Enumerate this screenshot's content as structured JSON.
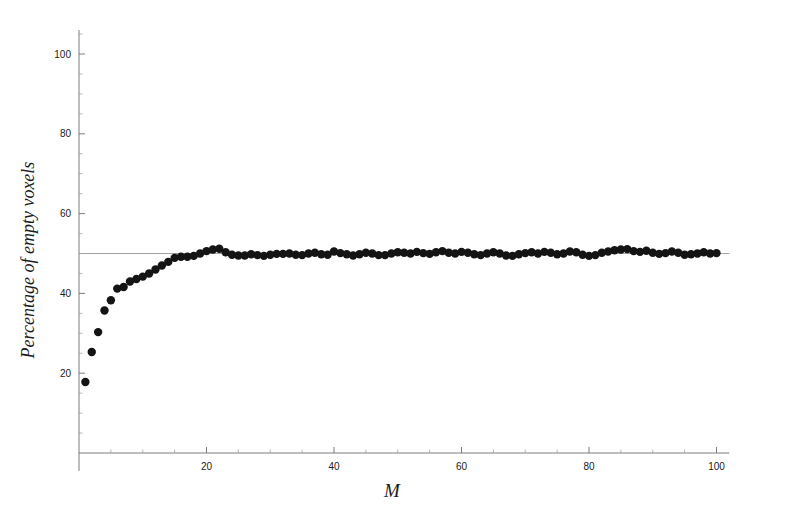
{
  "chart_data": {
    "type": "scatter",
    "title": "",
    "xlabel": "M",
    "ylabel": "Percentage of empty voxels",
    "xlim": [
      0,
      102
    ],
    "ylim": [
      0,
      106
    ],
    "grid": false,
    "legend": "none",
    "x_ticks": [
      20,
      40,
      60,
      80,
      100
    ],
    "y_ticks": [
      20,
      40,
      60,
      80,
      100
    ],
    "x_tick_labels": [
      "20",
      "40",
      "60",
      "80",
      "100"
    ],
    "y_tick_labels": [
      "20",
      "40",
      "60",
      "80",
      "100"
    ],
    "x_minor_step": 5,
    "y_minor_step": 5,
    "annotations": [
      {
        "name": "asymptote-line",
        "type": "hline",
        "value": 50,
        "color": "#8a8a8e"
      }
    ],
    "marker": {
      "shape": "circle",
      "size": 4.2,
      "color": "#141414"
    },
    "x": [
      1,
      2,
      3,
      4,
      5,
      6,
      7,
      8,
      9,
      10,
      11,
      12,
      13,
      14,
      15,
      16,
      17,
      18,
      19,
      20,
      21,
      22,
      23,
      24,
      25,
      26,
      27,
      28,
      29,
      30,
      31,
      32,
      33,
      34,
      35,
      36,
      37,
      38,
      39,
      40,
      41,
      42,
      43,
      44,
      45,
      46,
      47,
      48,
      49,
      50,
      51,
      52,
      53,
      54,
      55,
      56,
      57,
      58,
      59,
      60,
      61,
      62,
      63,
      64,
      65,
      66,
      67,
      68,
      69,
      70,
      71,
      72,
      73,
      74,
      75,
      76,
      77,
      78,
      79,
      80,
      81,
      82,
      83,
      84,
      85,
      86,
      87,
      88,
      89,
      90,
      91,
      92,
      93,
      94,
      95,
      96,
      97,
      98,
      99,
      100
    ],
    "values": [
      17.8,
      25.3,
      30.3,
      35.7,
      38.3,
      41.2,
      41.6,
      43.0,
      43.6,
      44.2,
      45.0,
      46.0,
      47.0,
      47.9,
      48.9,
      49.2,
      49.2,
      49.4,
      50.0,
      50.6,
      51.0,
      51.2,
      50.3,
      49.7,
      49.5,
      49.5,
      49.8,
      49.6,
      49.4,
      49.7,
      49.9,
      49.9,
      50.0,
      49.7,
      49.6,
      50.0,
      50.2,
      49.8,
      49.7,
      50.5,
      50.1,
      49.8,
      49.5,
      49.8,
      50.2,
      50.0,
      49.6,
      49.6,
      50.0,
      50.3,
      50.2,
      50.0,
      50.4,
      50.1,
      49.9,
      50.3,
      50.6,
      50.2,
      50.0,
      50.4,
      50.2,
      49.8,
      49.6,
      50.0,
      50.3,
      50.0,
      49.5,
      49.4,
      49.8,
      50.1,
      50.3,
      50.0,
      50.4,
      50.2,
      49.8,
      50.0,
      50.5,
      50.3,
      49.7,
      49.4,
      49.6,
      50.2,
      50.5,
      50.8,
      51.0,
      51.1,
      50.6,
      50.4,
      50.7,
      50.2,
      49.9,
      50.1,
      50.5,
      50.2,
      49.7,
      49.8,
      50.0,
      50.3,
      50.0,
      50.1
    ]
  },
  "axes": {
    "x_axis_name": "M",
    "y_axis_name": "Percentage of empty voxels"
  }
}
